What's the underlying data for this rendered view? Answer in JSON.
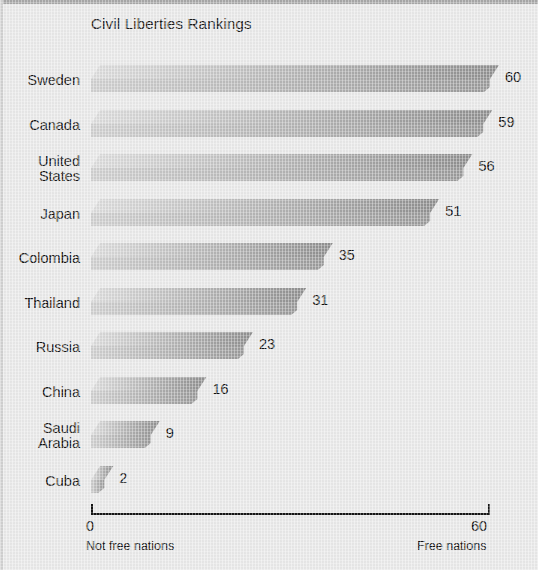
{
  "chart_data": {
    "type": "bar",
    "orientation": "horizontal",
    "title": "Civil Liberties Rankings",
    "xlabel": "",
    "ylabel": "",
    "xlim": [
      0,
      60
    ],
    "grid": false,
    "legend": null,
    "axis": {
      "min_tick_label": "0",
      "max_tick_label": "60",
      "min_caption": "Not free nations",
      "max_caption": "Free nations"
    },
    "categories": [
      "Sweden",
      "Canada",
      "United States",
      "Japan",
      "Colombia",
      "Thailand",
      "Russia",
      "China",
      "Saudi Arabia",
      "Cuba"
    ],
    "values": [
      60,
      59,
      56,
      51,
      35,
      31,
      23,
      16,
      9,
      2
    ],
    "data_labels": [
      "60",
      "59",
      "56",
      "51",
      "35",
      "31",
      "23",
      "16",
      "9",
      "2"
    ]
  },
  "bars": [
    {
      "label": "Sweden",
      "label_lines": "Sweden",
      "value": 60,
      "value_label": "60"
    },
    {
      "label": "Canada",
      "label_lines": "Canada",
      "value": 59,
      "value_label": "59"
    },
    {
      "label": "United States",
      "label_lines": "United\nStates",
      "value": 56,
      "value_label": "56"
    },
    {
      "label": "Japan",
      "label_lines": "Japan",
      "value": 51,
      "value_label": "51"
    },
    {
      "label": "Colombia",
      "label_lines": "Colombia",
      "value": 35,
      "value_label": "35"
    },
    {
      "label": "Thailand",
      "label_lines": "Thailand",
      "value": 31,
      "value_label": "31"
    },
    {
      "label": "Russia",
      "label_lines": "Russia",
      "value": 23,
      "value_label": "23"
    },
    {
      "label": "China",
      "label_lines": "China",
      "value": 16,
      "value_label": "16"
    },
    {
      "label": "Saudi Arabia",
      "label_lines": "Saudi\nArabia",
      "value": 9,
      "value_label": "9"
    },
    {
      "label": "Cuba",
      "label_lines": "Cuba",
      "value": 2,
      "value_label": "2"
    }
  ],
  "colors": {
    "background": "#e9e9e9",
    "bar_top_light": "#dcdcdc",
    "bar_top_dark": "#8f8f8f",
    "bar_front_light": "#cfcfcf",
    "bar_front_dark": "#9a9a9a",
    "axis": "#151515",
    "text": "#131313",
    "frame_border": "#a8a8a8"
  }
}
